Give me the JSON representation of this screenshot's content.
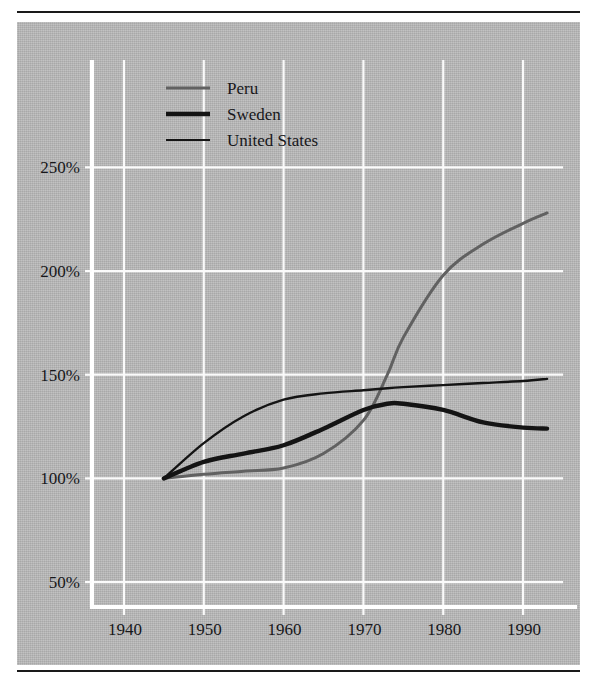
{
  "figure": {
    "panel_background": "#b4b4b4",
    "rule_color": "#1a1a1a",
    "gridline_color": "#fbfbfb"
  },
  "chart_data": {
    "type": "line",
    "title": "",
    "subtitle": "",
    "xlabel": "",
    "ylabel": "",
    "xlim": [
      1936,
      1995
    ],
    "ylim": [
      38,
      268
    ],
    "grid": true,
    "legend_position": "top-left-inside",
    "xticks": [
      1940,
      1950,
      1960,
      1970,
      1980,
      1990
    ],
    "xtick_labels": [
      "1940",
      "1950",
      "1960",
      "1970",
      "1980",
      "1990"
    ],
    "yticks": [
      50,
      100,
      150,
      200,
      250
    ],
    "ytick_labels": [
      "50%",
      "100%",
      "150%",
      "200%",
      "250%"
    ],
    "x": [
      1945,
      1950,
      1955,
      1960,
      1965,
      1970,
      1973,
      1975,
      1980,
      1985,
      1990,
      1993
    ],
    "series": [
      {
        "name": "Peru",
        "color": "#616161",
        "width": 3.0,
        "values": [
          100,
          102,
          103.5,
          105,
          112,
          128,
          150,
          168,
          198,
          213,
          223,
          228
        ]
      },
      {
        "name": "Sweden",
        "color": "#141414",
        "width": 4.4,
        "values": [
          100,
          108,
          112,
          116,
          124,
          133,
          136,
          136,
          133,
          127,
          124.5,
          124
        ]
      },
      {
        "name": "United States",
        "color": "#141414",
        "width": 2.4,
        "values": [
          100,
          117,
          130,
          138,
          141,
          142.5,
          143.5,
          144,
          145,
          146,
          147,
          148
        ]
      }
    ]
  },
  "legend": {
    "entries": [
      {
        "label": "Peru",
        "swatch_color": "#616161",
        "swatch_width": 3.0
      },
      {
        "label": "Sweden",
        "swatch_color": "#141414",
        "swatch_width": 4.6
      },
      {
        "label": "United States",
        "swatch_color": "#141414",
        "swatch_width": 2.2
      }
    ]
  }
}
